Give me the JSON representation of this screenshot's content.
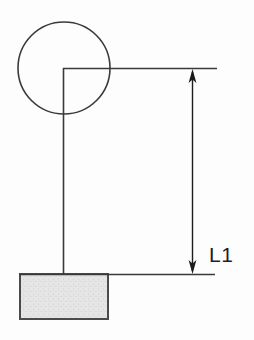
{
  "figure": {
    "dimension_label": "L1",
    "colors": {
      "background": "#fdfdfd",
      "line": "#3a3a3a",
      "arrow": "#1c1c1c",
      "text": "#1f1f1f",
      "block_fill": "#e6e6e6",
      "block_dot": "#cdcdcd",
      "block_border": "#4b4b4b"
    },
    "elements": {
      "pulley": {
        "cx": 64,
        "cy": 68,
        "r": 46
      },
      "rope_horizontal": {
        "x1": 63,
        "y1": 68.5,
        "x2": 217,
        "y2": 68.5
      },
      "rope_vertical": {
        "x1": 63.5,
        "y1": 68,
        "x2": 63.5,
        "y2": 275
      },
      "ground_line": {
        "x1": 19,
        "y1": 274.5,
        "x2": 215,
        "y2": 274.5
      },
      "dimension_line": {
        "x1": 192.5,
        "y1": 72,
        "x2": 192.5,
        "y2": 271
      },
      "arrowhead_top": "192.5,69 188.6,83 192.5,79.4 196.4,83",
      "arrowhead_bottom": "192.5,274 188.6,260 192.5,263.6 196.4,260",
      "block": {
        "x": 20,
        "y": 274,
        "width": 88,
        "height": 45
      },
      "label_pos": {
        "x": 209,
        "y": 262
      }
    }
  }
}
